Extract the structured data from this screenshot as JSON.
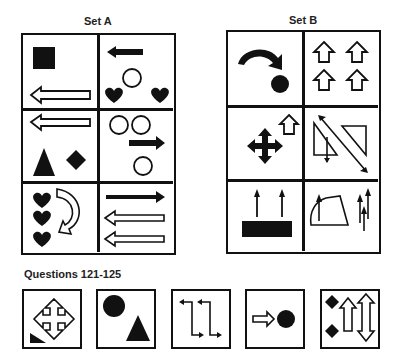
{
  "set_a": {
    "title": "Set A",
    "panels": [
      {
        "id": "a1",
        "contents": [
          "filled-square",
          "hollow-left-arrow"
        ]
      },
      {
        "id": "a2",
        "contents": [
          "filled-left-arrow",
          "hollow-circle",
          "heart",
          "heart"
        ]
      },
      {
        "id": "a3",
        "contents": [
          "hollow-left-arrow",
          "filled-triangle",
          "filled-diamond"
        ]
      },
      {
        "id": "a4",
        "contents": [
          "hollow-circle",
          "hollow-circle",
          "filled-right-arrow",
          "hollow-circle"
        ]
      },
      {
        "id": "a5",
        "contents": [
          "heart",
          "heart",
          "heart",
          "hollow-curved-arrow"
        ]
      },
      {
        "id": "a6",
        "contents": [
          "filled-right-arrow",
          "hollow-left-arrow",
          "hollow-left-arrow"
        ]
      }
    ]
  },
  "set_b": {
    "title": "Set B",
    "panels": [
      {
        "id": "b1",
        "contents": [
          "filled-curved-arrow",
          "filled-circle"
        ]
      },
      {
        "id": "b2",
        "contents": [
          "hollow-up-arrow",
          "hollow-up-arrow",
          "hollow-up-arrow",
          "hollow-up-arrow"
        ]
      },
      {
        "id": "b3",
        "contents": [
          "filled-four-way-arrow",
          "hollow-up-arrow"
        ]
      },
      {
        "id": "b4",
        "contents": [
          "hollow-triangle",
          "hollow-triangle",
          "diagonal-double-arrow",
          "down-arrow"
        ]
      },
      {
        "id": "b5",
        "contents": [
          "up-arrow",
          "up-arrow",
          "filled-rectangle"
        ]
      },
      {
        "id": "b6",
        "contents": [
          "hollow-quadrilateral",
          "up-arrow",
          "up-arrow",
          "up-arrow",
          "up-arrow"
        ]
      }
    ]
  },
  "questions": {
    "title": "Questions 121-125",
    "items": [
      {
        "number": 121,
        "contents": [
          "hollow-four-way-arrow",
          "filled-triangle-small"
        ]
      },
      {
        "number": 122,
        "contents": [
          "filled-circle",
          "filled-triangle"
        ]
      },
      {
        "number": 123,
        "contents": [
          "zigzag-arrow",
          "zigzag-arrow"
        ]
      },
      {
        "number": 124,
        "contents": [
          "hollow-right-arrow",
          "filled-circle"
        ]
      },
      {
        "number": 125,
        "contents": [
          "filled-diamond",
          "filled-diamond",
          "hollow-up-arrow",
          "hollow-double-vertical-arrow"
        ]
      }
    ]
  },
  "colors": {
    "ink": "#111111",
    "background": "#ffffff"
  }
}
